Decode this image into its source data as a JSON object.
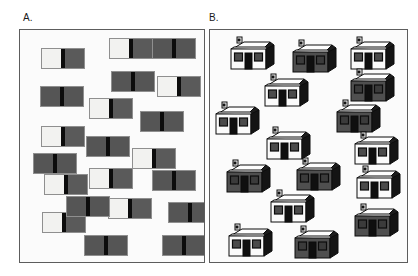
{
  "figure": {
    "caption_labels": {
      "panel_a": "A.",
      "panel_b": "B."
    }
  },
  "colors": {
    "background": "#ffffff",
    "panel_fill": "#fbfbfb",
    "panel_border": "#5d5d5d",
    "light_fill": "#f2f2f0",
    "dark_fill": "#555555",
    "divider_black": "#0c0c0c",
    "outline": "#0c0c0c",
    "roof_light": "#fdfdfd",
    "roof_shadow": "#1c1c1c",
    "wall_light": "#fbfbfb",
    "wall_dark": "#4f4f4f",
    "window_dark": "#4b4b4b",
    "door_black": "#0f0f0f",
    "side_shadow": "#141414"
  },
  "panel_a": {
    "name": "abstract-bicolour-rectangles",
    "label": "A.",
    "frame": {
      "x": 19,
      "y": 29,
      "width": 186,
      "height": 234
    },
    "item_size": {
      "width": 44,
      "height": 21
    },
    "count": 21,
    "light_count": 9,
    "dark_count": 12,
    "items": [
      {
        "id": 1,
        "variant": "light",
        "x": 21,
        "y": 18
      },
      {
        "id": 2,
        "variant": "light",
        "x": 89,
        "y": 8
      },
      {
        "id": 3,
        "variant": "dark",
        "x": 132,
        "y": 8
      },
      {
        "id": 4,
        "variant": "dark",
        "x": 91,
        "y": 41
      },
      {
        "id": 5,
        "variant": "light",
        "x": 137,
        "y": 46
      },
      {
        "id": 6,
        "variant": "dark",
        "x": 20,
        "y": 56
      },
      {
        "id": 7,
        "variant": "light",
        "x": 69,
        "y": 68
      },
      {
        "id": 8,
        "variant": "dark",
        "x": 120,
        "y": 81
      },
      {
        "id": 9,
        "variant": "light",
        "x": 21,
        "y": 96
      },
      {
        "id": 10,
        "variant": "dark",
        "x": 66,
        "y": 106
      },
      {
        "id": 11,
        "variant": "light",
        "x": 112,
        "y": 118
      },
      {
        "id": 12,
        "variant": "dark",
        "x": 13,
        "y": 123
      },
      {
        "id": 13,
        "variant": "light",
        "x": 69,
        "y": 138
      },
      {
        "id": 14,
        "variant": "dark",
        "x": 132,
        "y": 140
      },
      {
        "id": 15,
        "variant": "light",
        "x": 24,
        "y": 144
      },
      {
        "id": 16,
        "variant": "light",
        "x": 88,
        "y": 168
      },
      {
        "id": 17,
        "variant": "light",
        "x": 22,
        "y": 182
      },
      {
        "id": 18,
        "variant": "dark",
        "x": 64,
        "y": 205
      },
      {
        "id": 19,
        "variant": "dark",
        "x": 142,
        "y": 205
      },
      {
        "id": 20,
        "variant": "dark",
        "x": 46,
        "y": 166
      },
      {
        "id": 21,
        "variant": "dark",
        "x": 148,
        "y": 172
      }
    ]
  },
  "panel_b": {
    "name": "isometric-house-icons",
    "label": "B.",
    "frame": {
      "x": 209,
      "y": 29,
      "width": 199,
      "height": 234
    },
    "item_size": {
      "width": 54,
      "height": 40
    },
    "count": 16,
    "light_count": 9,
    "dark_count": 7,
    "house_parts": [
      "chimney",
      "roof",
      "front-wall",
      "side-wall",
      "left-window",
      "door",
      "right-window"
    ],
    "items": [
      {
        "id": 1,
        "variant": "light",
        "x": 16,
        "y": 5
      },
      {
        "id": 2,
        "variant": "dark",
        "x": 78,
        "y": 8
      },
      {
        "id": 3,
        "variant": "light",
        "x": 136,
        "y": 5
      },
      {
        "id": 4,
        "variant": "light",
        "x": 50,
        "y": 42
      },
      {
        "id": 5,
        "variant": "dark",
        "x": 136,
        "y": 37
      },
      {
        "id": 6,
        "variant": "light",
        "x": 1,
        "y": 70
      },
      {
        "id": 7,
        "variant": "dark",
        "x": 122,
        "y": 68
      },
      {
        "id": 8,
        "variant": "light",
        "x": 52,
        "y": 95
      },
      {
        "id": 9,
        "variant": "dark",
        "x": 12,
        "y": 128
      },
      {
        "id": 10,
        "variant": "dark",
        "x": 82,
        "y": 126
      },
      {
        "id": 11,
        "variant": "light",
        "x": 142,
        "y": 134
      },
      {
        "id": 12,
        "variant": "light",
        "x": 56,
        "y": 158
      },
      {
        "id": 13,
        "variant": "dark",
        "x": 140,
        "y": 172
      },
      {
        "id": 14,
        "variant": "light",
        "x": 14,
        "y": 192
      },
      {
        "id": 15,
        "variant": "dark",
        "x": 80,
        "y": 194
      },
      {
        "id": 16,
        "variant": "light",
        "x": 140,
        "y": 100
      }
    ]
  }
}
